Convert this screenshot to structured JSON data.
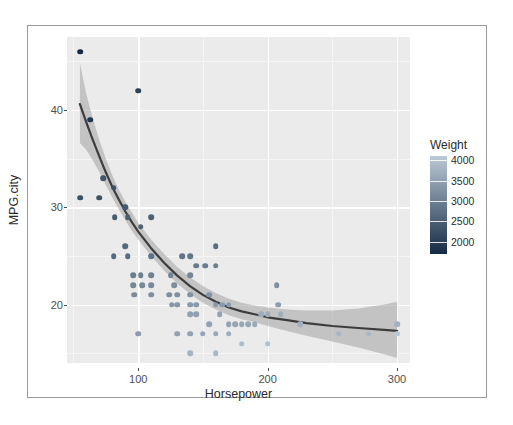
{
  "figure": {
    "background": "#ffffff",
    "panel_background": "#ebebeb",
    "gridline_color": "#ffffff",
    "frame_color": "#9a9a9a"
  },
  "chart_data": {
    "type": "scatter",
    "title": "",
    "xlabel": "Horsepower",
    "ylabel": "MPG.city",
    "xlim": [
      45,
      310
    ],
    "ylim": [
      14.0,
      47.5
    ],
    "xticks": [
      100,
      200,
      300
    ],
    "xtick_labels": [
      "100",
      "200",
      "300"
    ],
    "yticks": [
      20,
      30,
      40
    ],
    "ytick_labels": [
      "20",
      "30",
      "40"
    ],
    "grid": true,
    "minor_grid": true,
    "legend_position": "right",
    "color_legend": {
      "title": "Weight",
      "ticks": [
        2000,
        2500,
        3000,
        3500,
        4000
      ],
      "tick_labels": [
        "2000",
        "2500",
        "3000",
        "3500",
        "4000"
      ],
      "vmin": 1695,
      "vmax": 4105,
      "low_color": "#132b43",
      "high_color": "#bcc9d6",
      "orientation": "vertical",
      "reversed": false
    },
    "smooth": {
      "line_color": "#3d3d3d",
      "band_color": "#a3a3a3",
      "band_opacity": 0.55,
      "line_points": [
        [
          55,
          40.6
        ],
        [
          60,
          38.7
        ],
        [
          65,
          36.9
        ],
        [
          70,
          35.2
        ],
        [
          75,
          33.6
        ],
        [
          80,
          32.1
        ],
        [
          85,
          30.8
        ],
        [
          90,
          29.6
        ],
        [
          95,
          28.5
        ],
        [
          100,
          27.5
        ],
        [
          110,
          25.8
        ],
        [
          120,
          24.3
        ],
        [
          130,
          23.0
        ],
        [
          140,
          21.9
        ],
        [
          150,
          21.0
        ],
        [
          160,
          20.3
        ],
        [
          170,
          19.7
        ],
        [
          180,
          19.3
        ],
        [
          190,
          19.0
        ],
        [
          200,
          18.7
        ],
        [
          215,
          18.4
        ],
        [
          230,
          18.1
        ],
        [
          250,
          17.8
        ],
        [
          270,
          17.6
        ],
        [
          290,
          17.4
        ],
        [
          300,
          17.3
        ]
      ],
      "band_upper": [
        [
          55,
          44.8
        ],
        [
          60,
          41.6
        ],
        [
          65,
          39.1
        ],
        [
          70,
          36.9
        ],
        [
          75,
          35.0
        ],
        [
          80,
          33.3
        ],
        [
          85,
          31.8
        ],
        [
          90,
          30.6
        ],
        [
          95,
          29.5
        ],
        [
          100,
          28.4
        ],
        [
          110,
          26.7
        ],
        [
          120,
          25.2
        ],
        [
          130,
          23.9
        ],
        [
          140,
          22.8
        ],
        [
          150,
          21.9
        ],
        [
          160,
          21.2
        ],
        [
          170,
          20.6
        ],
        [
          180,
          20.2
        ],
        [
          190,
          19.9
        ],
        [
          200,
          19.7
        ],
        [
          215,
          19.5
        ],
        [
          230,
          19.4
        ],
        [
          250,
          19.4
        ],
        [
          270,
          19.6
        ],
        [
          290,
          20.0
        ],
        [
          300,
          20.3
        ]
      ],
      "band_lower": [
        [
          55,
          36.6
        ],
        [
          60,
          35.9
        ],
        [
          65,
          34.8
        ],
        [
          70,
          33.6
        ],
        [
          75,
          32.3
        ],
        [
          80,
          31.0
        ],
        [
          85,
          29.8
        ],
        [
          90,
          28.7
        ],
        [
          95,
          27.6
        ],
        [
          100,
          26.7
        ],
        [
          110,
          25.0
        ],
        [
          120,
          23.5
        ],
        [
          130,
          22.2
        ],
        [
          140,
          21.1
        ],
        [
          150,
          20.2
        ],
        [
          160,
          19.5
        ],
        [
          170,
          18.9
        ],
        [
          180,
          18.5
        ],
        [
          190,
          18.2
        ],
        [
          200,
          17.8
        ],
        [
          215,
          17.3
        ],
        [
          230,
          16.8
        ],
        [
          250,
          16.2
        ],
        [
          270,
          15.6
        ],
        [
          290,
          14.9
        ],
        [
          300,
          14.5
        ]
      ]
    },
    "points": [
      {
        "x": 55,
        "y": 46,
        "w": 1695
      },
      {
        "x": 100,
        "y": 42,
        "w": 2045
      },
      {
        "x": 63,
        "y": 39,
        "w": 1845
      },
      {
        "x": 73,
        "y": 33,
        "w": 2350
      },
      {
        "x": 55,
        "y": 31,
        "w": 2270
      },
      {
        "x": 70,
        "y": 31,
        "w": 2295
      },
      {
        "x": 81,
        "y": 32,
        "w": 2240
      },
      {
        "x": 90,
        "y": 30,
        "w": 2390
      },
      {
        "x": 82,
        "y": 29,
        "w": 2440
      },
      {
        "x": 92,
        "y": 29,
        "w": 2490
      },
      {
        "x": 110,
        "y": 29,
        "w": 2535
      },
      {
        "x": 102,
        "y": 28,
        "w": 2545
      },
      {
        "x": 81,
        "y": 25,
        "w": 2670
      },
      {
        "x": 92,
        "y": 25,
        "w": 2690
      },
      {
        "x": 90,
        "y": 26,
        "w": 2640
      },
      {
        "x": 110,
        "y": 25,
        "w": 2775
      },
      {
        "x": 134,
        "y": 25,
        "w": 2810
      },
      {
        "x": 140,
        "y": 25,
        "w": 2850
      },
      {
        "x": 160,
        "y": 26,
        "w": 2705
      },
      {
        "x": 145,
        "y": 24,
        "w": 2920
      },
      {
        "x": 152,
        "y": 24,
        "w": 2950
      },
      {
        "x": 160,
        "y": 24,
        "w": 2985
      },
      {
        "x": 96,
        "y": 23,
        "w": 2970
      },
      {
        "x": 102,
        "y": 23,
        "w": 2985
      },
      {
        "x": 110,
        "y": 23,
        "w": 3000
      },
      {
        "x": 125,
        "y": 23,
        "w": 3040
      },
      {
        "x": 140,
        "y": 23,
        "w": 3085
      },
      {
        "x": 96,
        "y": 22,
        "w": 3110
      },
      {
        "x": 103,
        "y": 22,
        "w": 3115
      },
      {
        "x": 110,
        "y": 22,
        "w": 3135
      },
      {
        "x": 97,
        "y": 21,
        "w": 3175
      },
      {
        "x": 110,
        "y": 21,
        "w": 3190
      },
      {
        "x": 128,
        "y": 22,
        "w": 3200
      },
      {
        "x": 124,
        "y": 21,
        "w": 3215
      },
      {
        "x": 130,
        "y": 21,
        "w": 3240
      },
      {
        "x": 140,
        "y": 21,
        "w": 3250
      },
      {
        "x": 155,
        "y": 21,
        "w": 3295
      },
      {
        "x": 126,
        "y": 20,
        "w": 3320
      },
      {
        "x": 130,
        "y": 20,
        "w": 3340
      },
      {
        "x": 140,
        "y": 20,
        "w": 3350
      },
      {
        "x": 145,
        "y": 20,
        "w": 3370
      },
      {
        "x": 160,
        "y": 20,
        "w": 3380
      },
      {
        "x": 165,
        "y": 20,
        "w": 3400
      },
      {
        "x": 170,
        "y": 20,
        "w": 3410
      },
      {
        "x": 207,
        "y": 22,
        "w": 3240
      },
      {
        "x": 208,
        "y": 20,
        "w": 3450
      },
      {
        "x": 140,
        "y": 19,
        "w": 3480
      },
      {
        "x": 145,
        "y": 19,
        "w": 3495
      },
      {
        "x": 155,
        "y": 18,
        "w": 3510
      },
      {
        "x": 163,
        "y": 19,
        "w": 3520
      },
      {
        "x": 170,
        "y": 18,
        "w": 3545
      },
      {
        "x": 175,
        "y": 18,
        "w": 3560
      },
      {
        "x": 180,
        "y": 18,
        "w": 3575
      },
      {
        "x": 185,
        "y": 18,
        "w": 3600
      },
      {
        "x": 190,
        "y": 18,
        "w": 3620
      },
      {
        "x": 195,
        "y": 19,
        "w": 3640
      },
      {
        "x": 200,
        "y": 19,
        "w": 3665
      },
      {
        "x": 210,
        "y": 19,
        "w": 3695
      },
      {
        "x": 225,
        "y": 18,
        "w": 3730
      },
      {
        "x": 100,
        "y": 17,
        "w": 3405
      },
      {
        "x": 130,
        "y": 17,
        "w": 3495
      },
      {
        "x": 140,
        "y": 17,
        "w": 3515
      },
      {
        "x": 150,
        "y": 17,
        "w": 3560
      },
      {
        "x": 160,
        "y": 17,
        "w": 3610
      },
      {
        "x": 170,
        "y": 17,
        "w": 3680
      },
      {
        "x": 140,
        "y": 15,
        "w": 3785
      },
      {
        "x": 160,
        "y": 15,
        "w": 3840
      },
      {
        "x": 180,
        "y": 16,
        "w": 3910
      },
      {
        "x": 200,
        "y": 16,
        "w": 3960
      },
      {
        "x": 255,
        "y": 17,
        "w": 3805
      },
      {
        "x": 278,
        "y": 17,
        "w": 3855
      },
      {
        "x": 300,
        "y": 17,
        "w": 4105
      },
      {
        "x": 300,
        "y": 18,
        "w": 3730
      }
    ]
  }
}
